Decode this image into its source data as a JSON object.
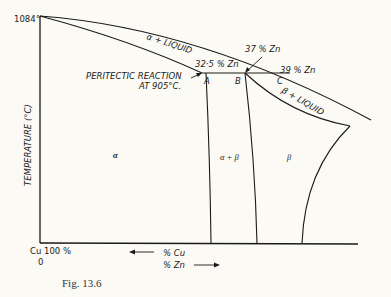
{
  "diagram": {
    "y_axis": {
      "label": "TEMPERATURE (°C)",
      "top_tick": "1084°"
    },
    "x_axis": {
      "origin_label": "Cu 100 %",
      "origin_value": "0",
      "cu_arrow_label": "% Cu",
      "zn_arrow_label": "% Zn"
    },
    "annotations": {
      "peritectic": "PERITECTIC REACTION",
      "peritectic_temp": "AT 905°C.",
      "point_a_comp": "32·5 % Zn",
      "point_b_comp": "37 % Zn",
      "point_c_comp": "39 % Zn",
      "point_a": "A",
      "point_b": "B",
      "point_c": "C"
    },
    "regions": {
      "alpha_liquid": "α + LIQUID",
      "beta_liquid": "β + LIQUID",
      "alpha": "α",
      "alpha_beta": "α + β",
      "beta": "β"
    },
    "caption": "Fig. 13.6"
  }
}
